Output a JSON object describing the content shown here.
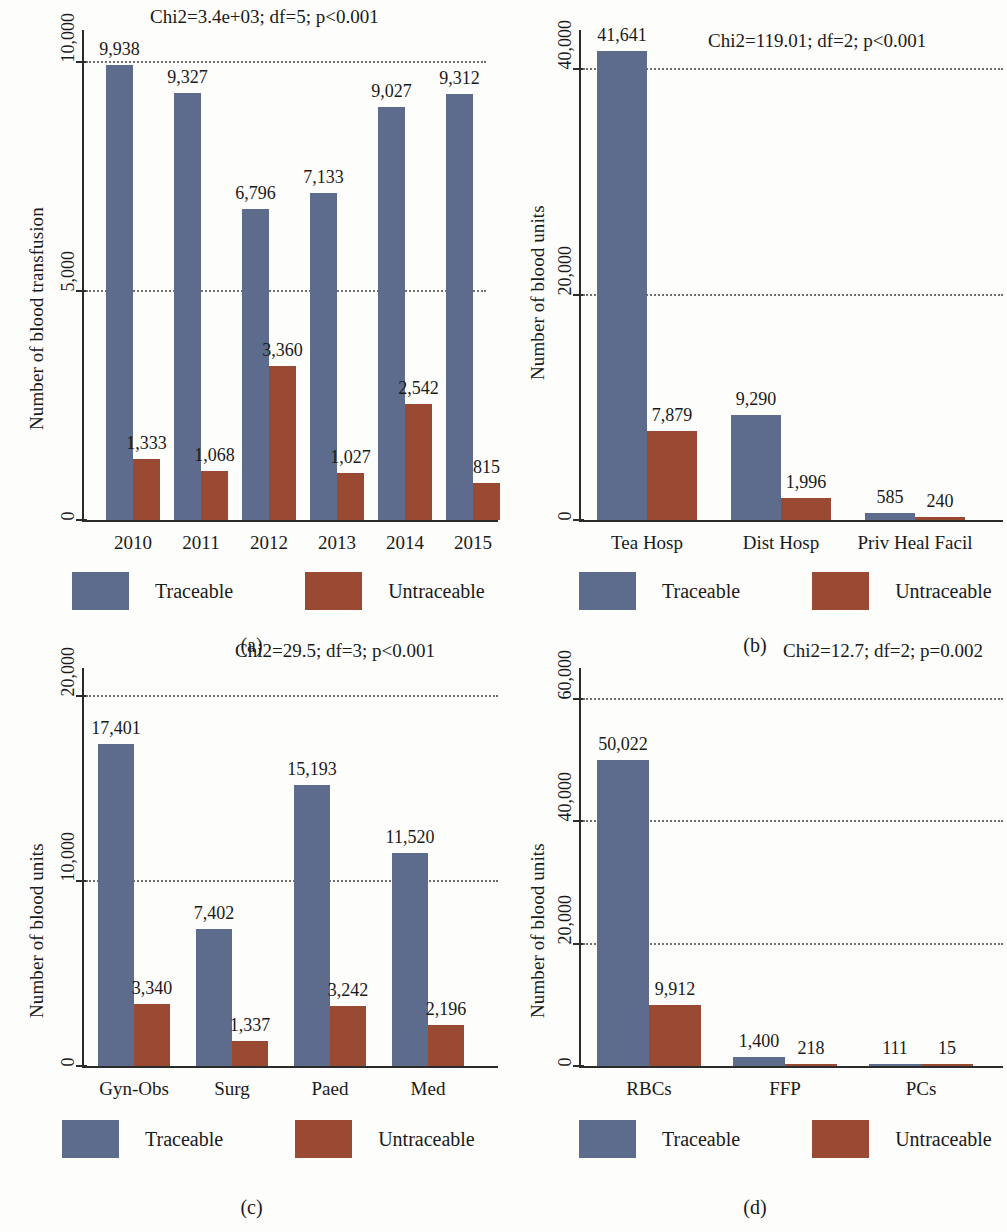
{
  "figure": {
    "legend": {
      "traceable_label": "Traceable",
      "untraceable_label": "Untraceable"
    },
    "colors": {
      "traceable": "#5d6c8c",
      "untraceable": "#9a4a33"
    }
  },
  "panels": {
    "a": {
      "caption": "(a)",
      "stat": "Chi2=3.4e+03; df=5; p<0.001",
      "ylabel": "Number of blood transfusion",
      "yticks": [
        "0",
        "5,000",
        "10,000"
      ]
    },
    "b": {
      "caption": "(b)",
      "stat": "Chi2=119.01; df=2; p<0.001",
      "ylabel": "Number of blood units",
      "yticks": [
        "0",
        "20,000",
        "40,000"
      ]
    },
    "c": {
      "caption": "(c)",
      "stat": "Chi2=29.5; df=3; p<0.001",
      "ylabel": "Number of blood units",
      "yticks": [
        "0",
        "10,000",
        "20,000"
      ]
    },
    "d": {
      "caption": "(d)",
      "stat": "Chi2=12.7; df=2; p=0.002",
      "ylabel": "Number of blood units",
      "yticks": [
        "0",
        "20,000",
        "40,000",
        "60,000"
      ]
    }
  },
  "chart_data": [
    {
      "type": "bar",
      "panel": "a",
      "title": "Chi2=3.4e+03; df=5; p<0.001",
      "xlabel": "",
      "ylabel": "Number of blood transfusion",
      "categories": [
        "2010",
        "2011",
        "2012",
        "2013",
        "2014",
        "2015"
      ],
      "series": [
        {
          "name": "Traceable",
          "color": "#5d6c8c",
          "values": [
            9938,
            9327,
            6796,
            7133,
            9027,
            9312
          ],
          "labels": [
            "9,938",
            "9,327",
            "6,796",
            "7,133",
            "9,027",
            "9,312"
          ]
        },
        {
          "name": "Untraceable",
          "color": "#9a4a33",
          "values": [
            1333,
            1068,
            3360,
            1027,
            2542,
            815
          ],
          "labels": [
            "1,333",
            "1,068",
            "3,360",
            "1,027",
            "2,542",
            "815"
          ]
        }
      ],
      "ylim": [
        0,
        10700
      ],
      "yticks": [
        0,
        5000,
        10000
      ],
      "ytick_labels": [
        "0",
        "5,000",
        "10,000"
      ],
      "grid": true,
      "legend_position": "bottom"
    },
    {
      "type": "bar",
      "panel": "b",
      "title": "Chi2=119.01; df=2; p<0.001",
      "xlabel": "",
      "ylabel": "Number of blood units",
      "categories": [
        "Tea Hosp",
        "Dist Hosp",
        "Priv Heal Facil"
      ],
      "series": [
        {
          "name": "Traceable",
          "color": "#5d6c8c",
          "values": [
            41641,
            9290,
            585
          ],
          "labels": [
            "41,641",
            "9,290",
            "585"
          ]
        },
        {
          "name": "Untraceable",
          "color": "#9a4a33",
          "values": [
            7879,
            1996,
            240
          ],
          "labels": [
            "7,879",
            "1,996",
            "240"
          ]
        }
      ],
      "ylim": [
        0,
        43500
      ],
      "yticks": [
        0,
        20000,
        40000
      ],
      "ytick_labels": [
        "0",
        "20,000",
        "40,000"
      ],
      "grid": true,
      "legend_position": "bottom"
    },
    {
      "type": "bar",
      "panel": "c",
      "title": "Chi2=29.5; df=3; p<0.001",
      "xlabel": "",
      "ylabel": "Number of blood units",
      "categories": [
        "Gyn-Obs",
        "Surg",
        "Paed",
        "Med"
      ],
      "series": [
        {
          "name": "Traceable",
          "color": "#5d6c8c",
          "values": [
            17401,
            7402,
            15193,
            11520
          ],
          "labels": [
            "17,401",
            "7,402",
            "15,193",
            "11,520"
          ]
        },
        {
          "name": "Untraceable",
          "color": "#9a4a33",
          "values": [
            3340,
            1337,
            3242,
            2196
          ],
          "labels": [
            "3,340",
            "1,337",
            "3,242",
            "2,196"
          ]
        }
      ],
      "ylim": [
        0,
        21500
      ],
      "yticks": [
        0,
        10000,
        20000
      ],
      "ytick_labels": [
        "0",
        "10,000",
        "20,000"
      ],
      "grid": true,
      "legend_position": "bottom"
    },
    {
      "type": "bar",
      "panel": "d",
      "title": "Chi2=12.7; df=2; p=0.002",
      "xlabel": "",
      "ylabel": "Number of blood units",
      "categories": [
        "RBCs",
        "FFP",
        "PCs"
      ],
      "series": [
        {
          "name": "Traceable",
          "color": "#5d6c8c",
          "values": [
            50022,
            1400,
            111
          ],
          "labels": [
            "50,022",
            "1,400",
            "111"
          ]
        },
        {
          "name": "Untraceable",
          "color": "#9a4a33",
          "values": [
            9912,
            218,
            15
          ],
          "labels": [
            "9,912",
            "218",
            "15"
          ]
        }
      ],
      "ylim": [
        0,
        65000
      ],
      "yticks": [
        0,
        20000,
        40000,
        60000
      ],
      "ytick_labels": [
        "0",
        "20,000",
        "40,000",
        "60,000"
      ],
      "grid": true,
      "legend_position": "bottom"
    }
  ]
}
